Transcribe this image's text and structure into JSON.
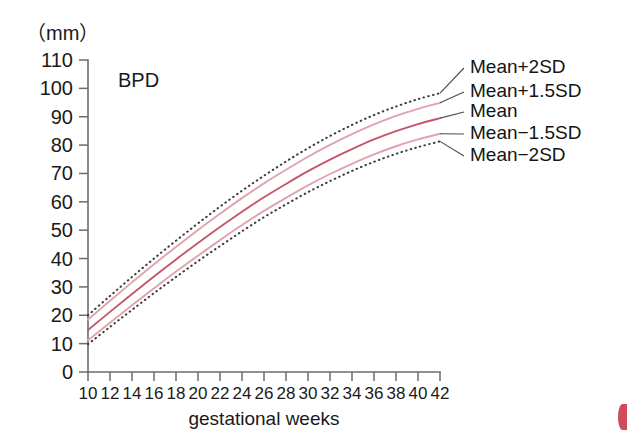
{
  "figure": {
    "unit_label": "（mm）",
    "plot_title": "BPD",
    "xaxis_title": "gestational weeks"
  },
  "legend": {
    "items": [
      {
        "label": "Mean+2SD",
        "style": "dotted",
        "color": "#3c3c3c"
      },
      {
        "label": "Mean+1.5SD",
        "style": "solid",
        "color": "#dfa3ad"
      },
      {
        "label": "Mean",
        "style": "solid",
        "color": "#c4566c"
      },
      {
        "label": "Mean−1.5SD",
        "style": "solid",
        "color": "#dfa3ad"
      },
      {
        "label": "Mean−2SD",
        "style": "dotted",
        "color": "#3c3c3c"
      }
    ]
  },
  "chart_data": {
    "type": "line",
    "title": "BPD",
    "xlabel": "gestational weeks",
    "ylabel": "（mm）",
    "xlim": [
      10,
      42
    ],
    "ylim": [
      0,
      110
    ],
    "xticks": [
      10,
      12,
      14,
      16,
      18,
      20,
      22,
      24,
      26,
      28,
      30,
      32,
      34,
      36,
      38,
      40,
      42
    ],
    "yticks": [
      0,
      10,
      20,
      30,
      40,
      50,
      60,
      70,
      80,
      90,
      100,
      110
    ],
    "grid": false,
    "legend_position": "right-outside",
    "x": [
      10,
      12,
      14,
      16,
      18,
      20,
      22,
      24,
      26,
      28,
      30,
      32,
      34,
      36,
      38,
      40,
      42
    ],
    "series": [
      {
        "name": "Mean+2SD",
        "style": "dotted",
        "color": "#3c3c3c",
        "values": [
          20.0,
          26.8,
          33.5,
          40.0,
          46.3,
          52.4,
          58.3,
          63.9,
          69.2,
          74.2,
          78.9,
          83.2,
          87.1,
          90.6,
          93.6,
          96.2,
          98.3
        ]
      },
      {
        "name": "Mean+1.5SD",
        "style": "solid",
        "color": "#dfa3ad",
        "values": [
          18.5,
          25.1,
          31.6,
          38.0,
          44.1,
          50.1,
          55.8,
          61.3,
          66.5,
          71.3,
          75.9,
          80.1,
          83.9,
          87.3,
          90.3,
          92.8,
          94.9
        ]
      },
      {
        "name": "Mean",
        "style": "solid",
        "color": "#c4566c",
        "values": [
          14.8,
          21.2,
          27.5,
          33.7,
          39.7,
          45.5,
          51.1,
          56.5,
          61.6,
          66.3,
          70.8,
          74.9,
          78.6,
          82.0,
          84.9,
          87.4,
          89.5
        ]
      },
      {
        "name": "Mean−1.5SD",
        "style": "solid",
        "color": "#dfa3ad",
        "values": [
          11.2,
          17.4,
          23.5,
          29.5,
          35.4,
          41.0,
          46.5,
          51.8,
          56.8,
          61.4,
          65.8,
          69.8,
          73.4,
          76.7,
          79.6,
          82.0,
          84.0
        ]
      },
      {
        "name": "Mean−2SD",
        "style": "dotted",
        "color": "#3c3c3c",
        "values": [
          9.8,
          15.9,
          21.9,
          27.8,
          33.5,
          39.1,
          44.4,
          49.6,
          54.6,
          59.1,
          63.4,
          67.3,
          70.9,
          74.1,
          76.9,
          79.3,
          81.3
        ]
      }
    ]
  }
}
